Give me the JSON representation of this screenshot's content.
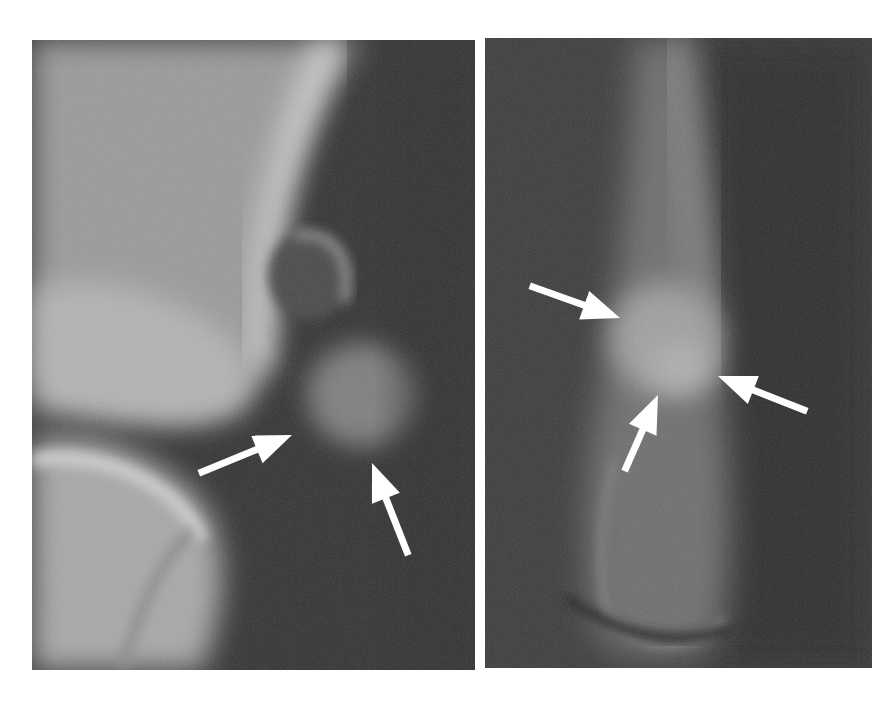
{
  "figure": {
    "background_color": "#ffffff",
    "arrow_color": "#ffffff",
    "panels": [
      {
        "id": "left",
        "label": "",
        "box": {
          "x": 32,
          "y": 40,
          "w": 443,
          "h": 630
        },
        "base_tone": "#3a3a3a",
        "arrows": [
          {
            "tail": [
              202,
              472
            ],
            "tip": [
              292,
              435
            ]
          },
          {
            "tail": [
              407,
              552
            ],
            "tip": [
              372,
              463
            ]
          }
        ]
      },
      {
        "id": "right",
        "label": "",
        "box": {
          "x": 485,
          "y": 38,
          "w": 387,
          "h": 630
        },
        "base_tone": "#3b3b3b",
        "arrows": [
          {
            "tail": [
              533,
              287
            ],
            "tip": [
              620,
              318
            ]
          },
          {
            "tail": [
              626,
              468
            ],
            "tip": [
              658,
              395
            ]
          },
          {
            "tail": [
              804,
              410
            ],
            "tip": [
              718,
              376
            ]
          }
        ]
      }
    ]
  }
}
